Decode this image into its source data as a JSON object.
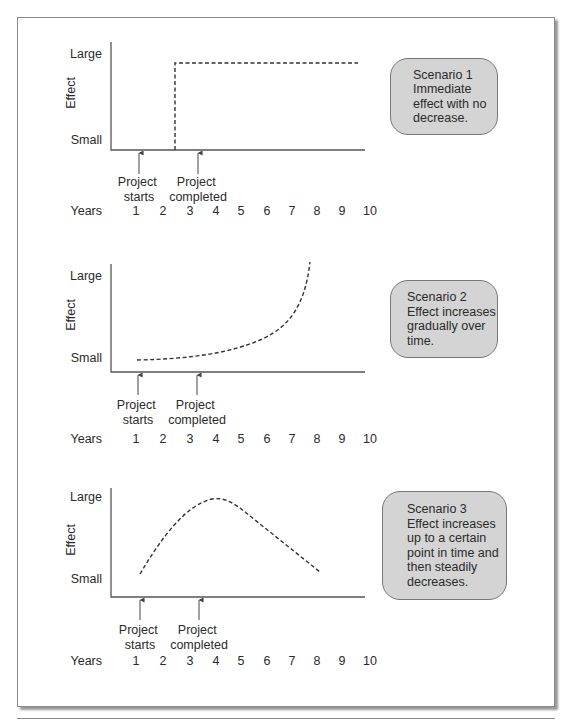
{
  "panels": [
    {
      "id": "scenario-1",
      "y_label": "Effect",
      "y_top_label": "Large",
      "y_bottom_label": "Small",
      "marker_start": [
        "Project",
        "starts"
      ],
      "marker_complete": [
        "Project",
        "completed"
      ],
      "x_title": "Years",
      "x_ticks": [
        "1",
        "2",
        "3",
        "4",
        "5",
        "6",
        "7",
        "8",
        "9",
        "10"
      ],
      "callout": {
        "title": "Scenario 1",
        "lines": [
          "Immediate",
          "effect with no",
          "decrease."
        ]
      }
    },
    {
      "id": "scenario-2",
      "y_label": "Effect",
      "y_top_label": "Large",
      "y_bottom_label": "Small",
      "marker_start": [
        "Project",
        "starts"
      ],
      "marker_complete": [
        "Project",
        "completed"
      ],
      "x_title": "Years",
      "x_ticks": [
        "1",
        "2",
        "3",
        "4",
        "5",
        "6",
        "7",
        "8",
        "9",
        "10"
      ],
      "callout": {
        "title": "Scenario 2",
        "lines": [
          "Effect increases",
          "gradually over",
          "time."
        ]
      }
    },
    {
      "id": "scenario-3",
      "y_label": "Effect",
      "y_top_label": "Large",
      "y_bottom_label": "Small",
      "marker_start": [
        "Project",
        "starts"
      ],
      "marker_complete": [
        "Project",
        "completed"
      ],
      "x_title": "Years",
      "x_ticks": [
        "1",
        "2",
        "3",
        "4",
        "5",
        "6",
        "7",
        "8",
        "9",
        "10"
      ],
      "callout": {
        "title": "Scenario 3",
        "lines": [
          "Effect increases",
          "up to a certain",
          "point in time and",
          "then steadily",
          "decreases."
        ]
      }
    }
  ],
  "colors": {
    "callout_fill": "#d4d4d4",
    "line": "#333333",
    "frame": "#8a8a8a"
  }
}
